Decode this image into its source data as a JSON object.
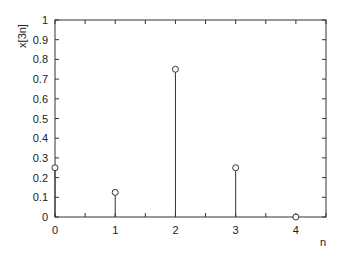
{
  "chart_data": {
    "type": "stem",
    "title": "",
    "xlabel": "n",
    "ylabel": "x[3n]",
    "x": [
      0,
      1,
      2,
      3,
      4
    ],
    "values": [
      0.25,
      0.125,
      0.75,
      0.25,
      0
    ],
    "xlim": [
      0,
      4.5
    ],
    "ylim": [
      0,
      1
    ],
    "xticks": [
      0,
      1,
      2,
      3,
      4
    ],
    "xtick_labels": [
      "0",
      "1",
      "2",
      "3",
      "4"
    ],
    "yticks": [
      0,
      0.1,
      0.2,
      0.3,
      0.4,
      0.5,
      0.6,
      0.7,
      0.8,
      0.9,
      1
    ],
    "ytick_labels": [
      "0",
      "0.1",
      "0.2",
      "0.3",
      "0.4",
      "0.5",
      "0.6",
      "0.7",
      "0.8",
      "0.9",
      "1"
    ],
    "minor_xtick_step": 0.5,
    "grid": false,
    "marker": "circle-open",
    "color": "#333333"
  }
}
